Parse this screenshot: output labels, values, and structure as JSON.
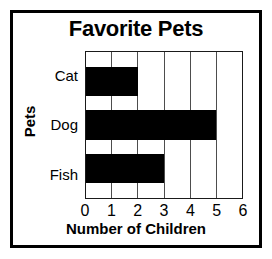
{
  "chart_data": {
    "type": "bar",
    "orientation": "horizontal",
    "title": "Favorite Pets",
    "xlabel": "Number of Children",
    "ylabel": "Pets",
    "categories": [
      "Cat",
      "Dog",
      "Fish"
    ],
    "values": [
      2,
      5,
      3
    ],
    "xlim": [
      0,
      6
    ],
    "xticks": [
      "0",
      "1",
      "2",
      "3",
      "4",
      "5",
      "6"
    ],
    "grid": true,
    "legend": null,
    "bar_color": "#000000",
    "background_color": "#ffffff",
    "frame_color": "#000000"
  }
}
